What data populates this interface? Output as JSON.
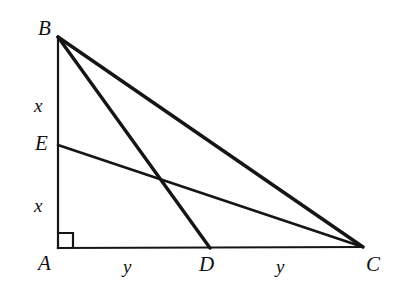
{
  "figure": {
    "background_color": "#ffffff",
    "stroke_color": "#151515",
    "canvas": {
      "width": 398,
      "height": 303
    }
  },
  "vertices": {
    "A": {
      "label": "A",
      "x": 58,
      "y": 248,
      "label_x": 38,
      "label_y": 253
    },
    "B": {
      "label": "B",
      "x": 58,
      "y": 37,
      "label_x": 38,
      "label_y": 18
    },
    "C": {
      "label": "C",
      "x": 363,
      "y": 247,
      "label_x": 366,
      "label_y": 254
    },
    "D": {
      "label": "D",
      "x": 210,
      "y": 248,
      "label_x": 199,
      "label_y": 254
    },
    "E": {
      "label": "E",
      "x": 58,
      "y": 145,
      "label_x": 35,
      "label_y": 133
    }
  },
  "segments": [
    {
      "name": "AB",
      "from": "A",
      "to": "B",
      "width": 2.2
    },
    {
      "name": "AC",
      "from": "A",
      "to": "C",
      "width": 2.2
    },
    {
      "name": "BC",
      "from": "B",
      "to": "C",
      "width": 3.4
    },
    {
      "name": "BD",
      "from": "B",
      "to": "D",
      "width": 3.4
    },
    {
      "name": "EC",
      "from": "E",
      "to": "C",
      "width": 2.6
    }
  ],
  "length_labels": [
    {
      "name": "BE",
      "text": "x",
      "x": 34,
      "y": 96
    },
    {
      "name": "EA",
      "text": "x",
      "x": 34,
      "y": 196
    },
    {
      "name": "AD",
      "text": "y",
      "x": 123,
      "y": 257
    },
    {
      "name": "DC",
      "text": "y",
      "x": 276,
      "y": 257
    }
  ],
  "right_angle": {
    "name": "right-angle-at-A",
    "vertex": "A",
    "size": 15,
    "points": "58,233 73,233 73,248"
  }
}
